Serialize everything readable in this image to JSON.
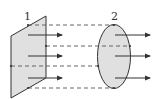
{
  "diagram": {
    "type": "flux-through-surfaces",
    "surfaces": [
      {
        "id": "1",
        "label": "1",
        "shape": "parallelogram"
      },
      {
        "id": "2",
        "label": "2",
        "shape": "ellipse"
      }
    ],
    "field_arrows": {
      "left_count": 3,
      "right_count": 3,
      "direction": "right"
    },
    "projection_lines": {
      "count": 4,
      "style": "dashed"
    },
    "colors": {
      "surface_fill": "#e0e0e0",
      "stroke": "#333333",
      "dashed": "#555555",
      "background": "#ffffff"
    }
  }
}
